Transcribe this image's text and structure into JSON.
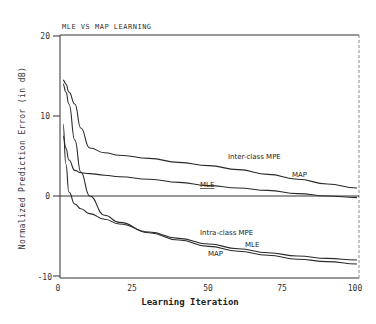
{
  "chart_data": {
    "type": "line",
    "title": "MLE VS MAP LEARNING",
    "xlabel": "Learning Iteration",
    "ylabel": "Normalized Prediction Error (in dB)",
    "xlim": [
      0,
      100
    ],
    "ylim": [
      -10,
      20
    ],
    "xticks": [
      "0",
      "25",
      "50",
      "75",
      "100"
    ],
    "yticks": [
      "20",
      "10",
      "0",
      "-10"
    ],
    "grid": false,
    "reference_line_y": 0,
    "annotations": [
      {
        "text": "Inter-class MPE",
        "x": 57,
        "y": 4.8
      },
      {
        "text": "MAP",
        "x": 78,
        "y": 2.8
      },
      {
        "text": "MLE",
        "x": 43,
        "y": 1.6
      },
      {
        "text": "Intra-class MPE",
        "x": 46,
        "y": -4.4
      },
      {
        "text": "MLE",
        "x": 64,
        "y": -5.8
      },
      {
        "text": "MAP",
        "x": 50,
        "y": -7.0
      }
    ],
    "x": [
      1,
      2,
      3,
      5,
      7,
      10,
      15,
      20,
      30,
      40,
      50,
      60,
      70,
      80,
      90,
      100
    ],
    "series": [
      {
        "name": "Inter-class MAP",
        "values": [
          14.5,
          14.0,
          13.0,
          11.5,
          8.5,
          6.0,
          5.4,
          5.1,
          4.7,
          4.2,
          3.8,
          3.3,
          2.7,
          2.1,
          1.5,
          1.0
        ]
      },
      {
        "name": "Inter-class MLE",
        "values": [
          7.5,
          6.0,
          4.5,
          3.2,
          2.9,
          2.8,
          2.6,
          2.4,
          2.1,
          1.7,
          1.3,
          1.0,
          0.7,
          0.3,
          0.0,
          -0.2
        ]
      },
      {
        "name": "Intra-class MLE",
        "values": [
          9.0,
          4.0,
          0.5,
          -1.0,
          -1.6,
          -2.2,
          -2.9,
          -3.5,
          -4.5,
          -5.3,
          -6.0,
          -6.6,
          -7.1,
          -7.5,
          -7.8,
          -8.0
        ]
      },
      {
        "name": "Intra-class MAP",
        "values": [
          14.0,
          13.0,
          11.5,
          7.0,
          3.0,
          0.0,
          -2.4,
          -3.3,
          -4.6,
          -5.5,
          -6.3,
          -6.9,
          -7.4,
          -7.9,
          -8.2,
          -8.5
        ]
      }
    ]
  },
  "labels": {
    "title": "MLE VS MAP LEARNING",
    "xlabel": "Learning Iteration",
    "ylabel": "Normalized Prediction Error (in dB)",
    "ann_inter": "Inter-class MPE",
    "ann_inter_map": "MAP",
    "ann_inter_mle": "MLE",
    "ann_intra": "Intra-class MPE",
    "ann_intra_mle": "MLE",
    "ann_intra_map": "MAP"
  },
  "colors": {
    "line": "#2a2a2a",
    "axis": "#333333",
    "background": "#ffffff"
  }
}
